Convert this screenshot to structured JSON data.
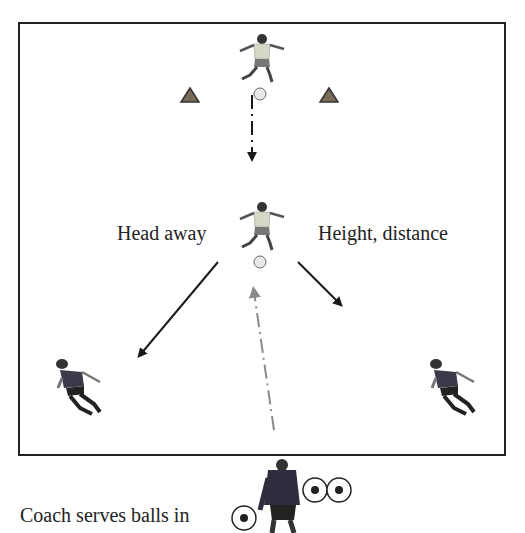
{
  "diagram": {
    "labels": {
      "left": "Head away",
      "right": "Height, distance",
      "coach": "Coach serves balls in"
    },
    "elements": {
      "top_player": "server-player",
      "cones": [
        "cone-left",
        "cone-right"
      ],
      "center_player": "heading-player",
      "side_players": [
        "receiver-left",
        "receiver-right"
      ],
      "coach": "coach-with-balls"
    },
    "colors": {
      "border": "#222222",
      "arrow": "#1a1a1a",
      "serve_arrow": "#8a8a8a",
      "cone": "#7a6a5a",
      "jersey_light": "#d8d8c8",
      "jersey_dark": "#3a3a4a"
    }
  }
}
